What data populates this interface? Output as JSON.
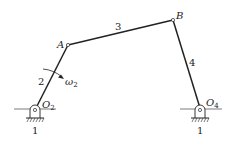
{
  "diagram": {
    "type": "four-bar linkage",
    "links": {
      "frame": "1",
      "crank": "2",
      "coupler": "3",
      "rocker": "4"
    },
    "joints": {
      "A": "A",
      "B": "B",
      "O2": {
        "main": "O",
        "sub": "2"
      },
      "O4": {
        "main": "O",
        "sub": "4"
      }
    },
    "angular_velocity": {
      "main": "ω",
      "sub": "2"
    },
    "ground_labels": [
      "1",
      "1"
    ],
    "colors": {
      "line": "#222222",
      "background": "#ffffff"
    }
  }
}
